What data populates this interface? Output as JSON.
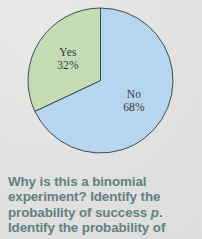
{
  "page": {
    "background_color": "#e4e4e2"
  },
  "chart_data": {
    "type": "pie",
    "title": "",
    "categories": [
      "Yes",
      "No"
    ],
    "values": [
      32,
      68
    ],
    "value_unit": "%",
    "labels": [
      {
        "name": "Yes",
        "percent": "32%",
        "color": "#c5dcb5"
      },
      {
        "name": "No",
        "percent": "68%",
        "color": "#b7d6f0"
      }
    ],
    "start_angle_deg": 0,
    "direction": "counterclockwise",
    "stroke_color": "#3f4b50",
    "stroke_width": 1,
    "legend": "none",
    "grid": false,
    "label_text_color": "#33363a"
  },
  "caption": {
    "color": "#63807d",
    "lines": [
      "Why is this a binomial",
      "experiment? Identify the",
      "probability of success ",
      "Identify the probability of"
    ],
    "line3_italic_symbol": "p",
    "line3_tail": ".",
    "full_text": "Why is this a binomial experiment? Identify the probability of success p. Identify the probability of"
  }
}
